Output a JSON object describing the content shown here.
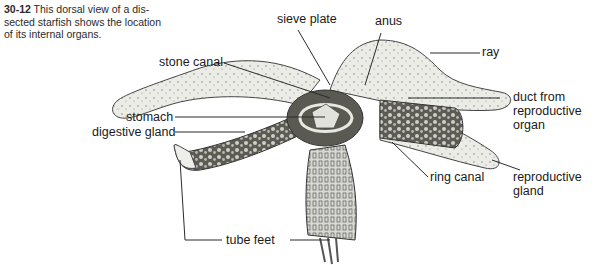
{
  "figure": {
    "number": "30-12",
    "caption": "This dorsal view of a dissected starfish shows the location of its internal organs.",
    "caption_lines": [
      "This dorsal view of a dis-",
      "sected starfish shows the location",
      "of its internal organs."
    ]
  },
  "labels": {
    "sieve_plate": "sieve plate",
    "anus": "anus",
    "ray": "ray",
    "stone_canal": "stone canal",
    "stomach": "stomach",
    "digestive_gland": "digestive gland",
    "duct_from_reproductive_organ": [
      "duct from",
      "reproductive",
      "organ"
    ],
    "ring_canal": "ring canal",
    "reproductive_gland": [
      "reproductive",
      "gland"
    ],
    "tube_feet": "tube feet"
  },
  "colors": {
    "background": "#ffffff",
    "line": "#2b2b2b",
    "body_fill": "#ebebe6",
    "interior_fill": "#7a7a72"
  }
}
